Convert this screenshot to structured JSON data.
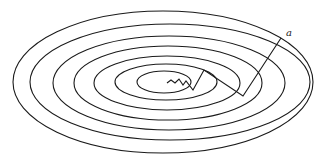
{
  "diagram": {
    "type": "contour-plot-with-descent-path",
    "label": "a",
    "stroke_color": "#1a1a1a",
    "background": "#ffffff",
    "contours": [
      {
        "cx": 164,
        "cy": 82,
        "rx": 27,
        "ry": 11
      },
      {
        "cx": 166,
        "cy": 82,
        "rx": 51,
        "ry": 18
      },
      {
        "cx": 167,
        "cy": 83,
        "rx": 73,
        "ry": 27
      },
      {
        "cx": 168,
        "cy": 83,
        "rx": 94,
        "ry": 37
      },
      {
        "cx": 169,
        "cy": 83,
        "rx": 116,
        "ry": 47
      },
      {
        "cx": 170,
        "cy": 82,
        "rx": 140,
        "ry": 58
      },
      {
        "cx": 163,
        "cy": 82,
        "rx": 150,
        "ry": 71
      }
    ],
    "descent_path": [
      [
        281,
        38
      ],
      [
        243,
        96
      ],
      [
        204,
        70
      ],
      [
        193,
        90
      ],
      [
        186,
        81
      ],
      [
        183,
        85
      ],
      [
        179,
        79
      ],
      [
        175,
        83
      ],
      [
        171,
        80
      ],
      [
        167,
        83
      ]
    ],
    "label_position": [
      286,
      36
    ]
  }
}
